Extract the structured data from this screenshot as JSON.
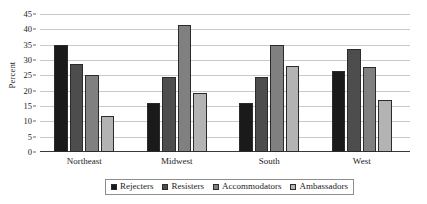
{
  "chart_data": {
    "type": "bar",
    "title": "",
    "subtitle": "",
    "xlabel": "",
    "ylabel": "Percent",
    "ylim": [
      0,
      45
    ],
    "ytick_step": 5,
    "yticks": [
      0,
      5,
      10,
      15,
      20,
      25,
      30,
      35,
      40,
      45
    ],
    "grid": true,
    "grid_axis": "y",
    "legend_position": "bottom",
    "categories": [
      "Northeast",
      "Midwest",
      "South",
      "West"
    ],
    "series": [
      {
        "name": "Rejecters",
        "color": "#1a1a1a",
        "values": [
          35.0,
          16.0,
          16.0,
          26.5
        ]
      },
      {
        "name": "Resisters",
        "color": "#4d4d4d",
        "values": [
          28.6,
          24.6,
          24.4,
          33.6
        ]
      },
      {
        "name": "Accommodators",
        "color": "#808080",
        "values": [
          25.1,
          41.5,
          34.8,
          27.7
        ]
      },
      {
        "name": "Ambassadors",
        "color": "#b3b3b3",
        "values": [
          11.8,
          19.4,
          28.0,
          17.0
        ]
      }
    ]
  },
  "axis": {
    "y_title": "Percent"
  }
}
